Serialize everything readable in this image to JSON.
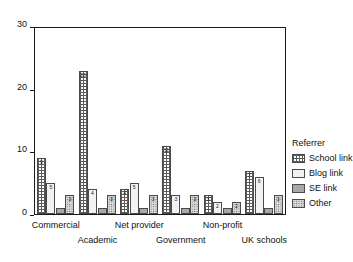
{
  "chart_data": {
    "type": "bar",
    "title": "",
    "xlabel": "",
    "ylabel": "",
    "ylim": [
      0,
      30
    ],
    "yticks": [
      0,
      10,
      20,
      30
    ],
    "grid": false,
    "legend_position": "right",
    "legend_title": "Referrer",
    "categories": [
      "Commercial",
      "Academic",
      "Net provider",
      "Government",
      "Non-profit",
      "UK schools"
    ],
    "series": [
      {
        "name": "School link",
        "pattern": "grid-hatch",
        "color": "#5a5a5a",
        "values": [
          9,
          23,
          4,
          11,
          3,
          7
        ]
      },
      {
        "name": "Blog link",
        "pattern": "fine-dots",
        "color": "#f2f2f2",
        "values": [
          5,
          4,
          5,
          3,
          2,
          6
        ]
      },
      {
        "name": "SE link",
        "pattern": "solid-gray",
        "color": "#a8a8a8",
        "values": [
          1,
          1,
          1,
          1,
          1,
          1
        ]
      },
      {
        "name": "Other",
        "pattern": "coarse-dots",
        "color": "#d9d9d9",
        "values": [
          3,
          3,
          3,
          3,
          2,
          3
        ]
      }
    ],
    "bar_labels": {
      "Commercial": [
        "9",
        "5",
        "",
        "3"
      ],
      "Academic": [
        "23",
        "4",
        "",
        "3"
      ],
      "Net provider": [
        "4",
        "5",
        "",
        "3"
      ],
      "Government": [
        "11",
        "3",
        "",
        "3"
      ],
      "Non-profit": [
        "3",
        "2",
        "",
        "2"
      ],
      "UK schools": [
        "7",
        "6",
        "",
        "3"
      ]
    }
  },
  "axes": {
    "y_tick_labels": [
      "0",
      "10",
      "20",
      "30"
    ]
  },
  "legend": {
    "title": "Referrer",
    "items": [
      {
        "label": "School link"
      },
      {
        "label": "Blog link"
      },
      {
        "label": "SE link"
      },
      {
        "label": "Other"
      }
    ]
  }
}
